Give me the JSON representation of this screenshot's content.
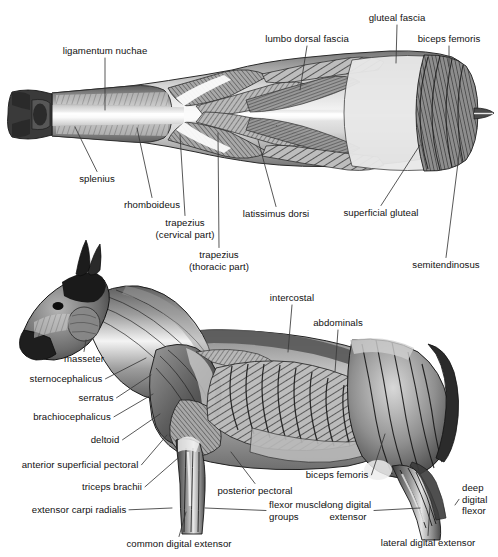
{
  "figure": {
    "views": [
      {
        "name": "dorsal-view",
        "description": "Dorsal (top-down) view of horse musculature"
      },
      {
        "name": "lateral-view",
        "description": "Lateral (side) view of horse musculature"
      }
    ],
    "ink_color": "#1a1a1a",
    "leader_color": "#3a3a3a",
    "background_color": "#ffffff"
  },
  "labels": {
    "dorsal": [
      {
        "id": "ligamentum-nuchae",
        "text": "ligamentum nuchae",
        "x": 105,
        "y": 45,
        "align": "c",
        "anchor_x": 105,
        "anchor_y": 110
      },
      {
        "id": "lumbo-dorsal-fascia",
        "text": "lumbo dorsal fascia",
        "x": 307,
        "y": 33,
        "align": "c",
        "anchor_x": 300,
        "anchor_y": 90
      },
      {
        "id": "gluteal-fascia",
        "text": "gluteal fascia",
        "x": 397,
        "y": 12,
        "align": "c",
        "anchor_x": 396,
        "anchor_y": 63
      },
      {
        "id": "biceps-femoris-top",
        "text": "biceps femoris",
        "x": 449,
        "y": 33,
        "align": "c",
        "anchor_x": 449,
        "anchor_y": 66
      },
      {
        "id": "splenius",
        "text": "splenius",
        "x": 97,
        "y": 173,
        "align": "c",
        "anchor_x": 75,
        "anchor_y": 127
      },
      {
        "id": "rhomboideus",
        "text": "rhomboideus",
        "x": 152,
        "y": 199,
        "align": "c",
        "anchor_x": 137,
        "anchor_y": 128
      },
      {
        "id": "trapezius-cervical",
        "text": "trapezius\n(cervical part)",
        "x": 185,
        "y": 217,
        "align": "c",
        "anchor_x": 180,
        "anchor_y": 135
      },
      {
        "id": "trapezius-thoracic",
        "text": "trapezius\n(thoracic part)",
        "x": 219,
        "y": 249,
        "align": "c",
        "anchor_x": 218,
        "anchor_y": 133
      },
      {
        "id": "latissimus-dorsi",
        "text": "latissimus dorsi",
        "x": 276,
        "y": 208,
        "align": "c",
        "anchor_x": 258,
        "anchor_y": 140
      },
      {
        "id": "superficial-gluteal",
        "text": "superficial gluteal",
        "x": 381,
        "y": 207,
        "align": "c",
        "anchor_x": 420,
        "anchor_y": 145
      },
      {
        "id": "semitendinosus",
        "text": "semitendinosus",
        "x": 446,
        "y": 259,
        "align": "c",
        "anchor_x": 460,
        "anchor_y": 147
      }
    ],
    "lateral": [
      {
        "id": "intercostal",
        "text": "intercostal",
        "x": 292,
        "y": 292,
        "align": "c",
        "anchor_x": 288,
        "anchor_y": 352
      },
      {
        "id": "abdominals",
        "text": "abdominals",
        "x": 338,
        "y": 317,
        "align": "c",
        "anchor_x": 335,
        "anchor_y": 372
      },
      {
        "id": "masseter",
        "text": "masseter",
        "x": 84,
        "y": 353,
        "align": "c",
        "anchor_x": 86,
        "anchor_y": 340
      },
      {
        "id": "sternocephalicus",
        "text": "sternocephalicus",
        "x": 66,
        "y": 373,
        "align": "c",
        "anchor_x": 146,
        "anchor_y": 358
      },
      {
        "id": "serratus",
        "text": "serratus",
        "x": 96,
        "y": 392,
        "align": "c",
        "anchor_x": 151,
        "anchor_y": 375
      },
      {
        "id": "brachiocephalicus",
        "text": "brachiocephalicus",
        "x": 72,
        "y": 411,
        "align": "c",
        "anchor_x": 153,
        "anchor_y": 394
      },
      {
        "id": "deltoid",
        "text": "deltoid",
        "x": 105,
        "y": 434,
        "align": "c",
        "anchor_x": 160,
        "anchor_y": 414
      },
      {
        "id": "anterior-superficial-pectoral",
        "text": "anterior superficial pectoral",
        "x": 80,
        "y": 459,
        "align": "c",
        "anchor_x": 167,
        "anchor_y": 435
      },
      {
        "id": "triceps-brachii",
        "text": "triceps brachii",
        "x": 112,
        "y": 481,
        "align": "c",
        "anchor_x": 178,
        "anchor_y": 458
      },
      {
        "id": "extensor-carpi-radialis",
        "text": "extensor carpi radialis",
        "x": 79,
        "y": 504,
        "align": "c",
        "anchor_x": 172,
        "anchor_y": 508
      },
      {
        "id": "common-digital-extensor",
        "text": "common digital extensor",
        "x": 179,
        "y": 538,
        "align": "c",
        "anchor_x": 186,
        "anchor_y": 512
      },
      {
        "id": "posterior-pectoral",
        "text": "posterior pectoral",
        "x": 255,
        "y": 485,
        "align": "c",
        "anchor_x": 231,
        "anchor_y": 452
      },
      {
        "id": "flexor-muscle-groups",
        "text": "flexor muscle\ngroups",
        "x": 269,
        "y": 499,
        "align": "l",
        "anchor_x": 205,
        "anchor_y": 508
      },
      {
        "id": "biceps-femoris-bottom",
        "text": "biceps femoris",
        "x": 337,
        "y": 469,
        "align": "c",
        "anchor_x": 385,
        "anchor_y": 434
      },
      {
        "id": "long-digital-extensor",
        "text": "long digital\nextensor",
        "x": 348,
        "y": 499,
        "align": "c",
        "anchor_x": 420,
        "anchor_y": 508
      },
      {
        "id": "lateral-digital-extensor",
        "text": "lateral digital extensor",
        "x": 428,
        "y": 537,
        "align": "c",
        "anchor_x": 430,
        "anchor_y": 506
      },
      {
        "id": "deep-digital-flexor",
        "text": "deep\ndigital\nflexor",
        "x": 462,
        "y": 482,
        "align": "l",
        "anchor_x": 455,
        "anchor_y": 505
      }
    ]
  }
}
